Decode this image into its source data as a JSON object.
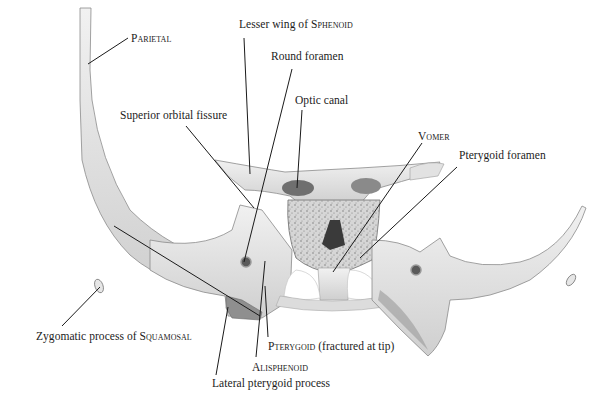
{
  "figure": {
    "colors": {
      "background": "#ffffff",
      "bone_light": "#e9e9e9",
      "bone_mid": "#c9c9c9",
      "bone_dark": "#7a7a7a",
      "leader_line": "#1a1a1a",
      "text": "#1b1b1b"
    }
  },
  "labels": [
    {
      "id": "parietal",
      "pre": "",
      "sc": "Parietal",
      "post": "",
      "x": 131,
      "y": 32,
      "line": [
        [
          128,
          38
        ],
        [
          88,
          64
        ]
      ]
    },
    {
      "id": "lesser-wing",
      "pre": "Lesser wing of ",
      "sc": "Sphenoid",
      "post": "",
      "x": 239,
      "y": 18,
      "line": [
        [
          244,
          38
        ],
        [
          250,
          174
        ]
      ]
    },
    {
      "id": "round-foramen",
      "pre": "Round foramen",
      "sc": "",
      "post": "",
      "x": 271,
      "y": 50,
      "line": [
        [
          292,
          69
        ],
        [
          244,
          262
        ]
      ]
    },
    {
      "id": "optic-canal",
      "pre": "Optic canal",
      "sc": "",
      "post": "",
      "x": 295,
      "y": 94,
      "line": [
        [
          302,
          110
        ],
        [
          297,
          188
        ]
      ]
    },
    {
      "id": "superior-orbital-fissure",
      "pre": "Superior orbital fissure",
      "sc": "",
      "post": "",
      "x": 120,
      "y": 109,
      "line": [
        [
          186,
          126
        ],
        [
          254,
          208
        ]
      ]
    },
    {
      "id": "vomer",
      "pre": "",
      "sc": "Vomer",
      "post": "",
      "x": 418,
      "y": 130,
      "line": [
        [
          422,
          143
        ],
        [
          333,
          272
        ]
      ]
    },
    {
      "id": "pterygoid-foramen",
      "pre": "Pterygoid foramen",
      "sc": "",
      "post": "",
      "x": 459,
      "y": 149,
      "line": [
        [
          457,
          167
        ],
        [
          360,
          258
        ]
      ]
    },
    {
      "id": "zygomatic-process",
      "pre": "Zygomatic process of ",
      "sc": "Squamosal",
      "post": "",
      "x": 36,
      "y": 330,
      "line": [
        [
          62,
          326
        ],
        [
          100,
          287
        ]
      ]
    },
    {
      "id": "pterygoid",
      "pre": "",
      "sc": "Pterygoid",
      "post": " (fractured at tip)",
      "x": 268,
      "y": 340,
      "line": [
        [
          268,
          337
        ],
        [
          265,
          286
        ]
      ]
    },
    {
      "id": "alisphenoid",
      "pre": "",
      "sc": "Alisphenoid",
      "post": "",
      "x": 252,
      "y": 361,
      "line": [
        [
          256,
          357
        ],
        [
          265,
          261
        ]
      ]
    },
    {
      "id": "lateral-pterygoid-process",
      "pre": "Lateral pterygoid process",
      "sc": "",
      "post": "",
      "x": 212,
      "y": 377,
      "line": [
        [
          216,
          375
        ],
        [
          228,
          307
        ]
      ]
    }
  ],
  "extra_leader": {
    "id": "squamosal-to-pterygoid",
    "line": [
      [
        114,
        226
      ],
      [
        260,
        316
      ]
    ]
  }
}
